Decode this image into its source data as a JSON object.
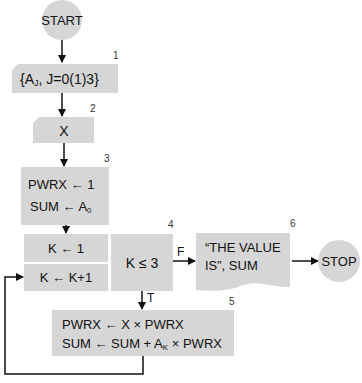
{
  "colors": {
    "fill": "#d6d6d6",
    "stroke": "#111111",
    "text": "#111111"
  },
  "nodes": {
    "start": {
      "label": "START"
    },
    "box1": {
      "number": "1",
      "label": "{A",
      "sub": "J",
      "rest": ",  J=0(1)3}"
    },
    "box2": {
      "number": "2",
      "label": "X"
    },
    "box3": {
      "number": "3",
      "line1": "PWRX  ←  1",
      "line2_a": "SUM  ←  A",
      "line2_sub": "0"
    },
    "init": {
      "label": "K  ←  1"
    },
    "incr": {
      "label": "K  ←  K+1"
    },
    "box4": {
      "number": "4",
      "label": "K  ≤  3"
    },
    "box5": {
      "number": "5",
      "line1": "PWRX  ←  X × PWRX",
      "line2_a": "SUM  ←  SUM + A",
      "line2_sub": "K",
      "line2_b": " × PWRX"
    },
    "box6": {
      "number": "6",
      "line1": "“THE VALUE",
      "line2": "IS”, SUM"
    },
    "stop": {
      "label": "STOP"
    }
  },
  "edges": {
    "false_label": "F",
    "true_label": "T"
  }
}
